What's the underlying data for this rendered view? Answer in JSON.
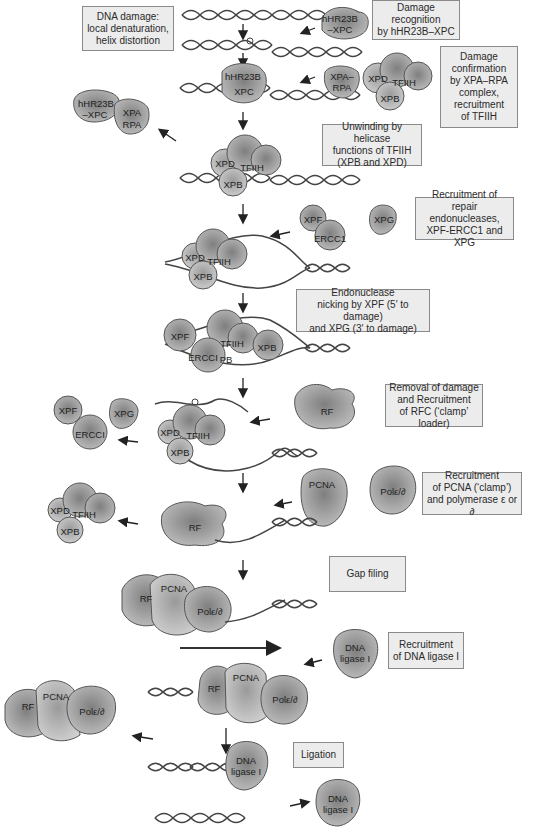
{
  "colors": {
    "protein_fill": "#a9a9a9",
    "protein_stroke": "#555555",
    "dna": "#444444",
    "box_fill": "#ececec",
    "box_border": "#8a8a8a",
    "arrow": "#222222"
  },
  "steps": [
    {
      "id": "dna-damage",
      "text": "DNA damage:\nlocal denaturation,\nhelix distortion"
    },
    {
      "id": "damage-recognition",
      "text": "Damage\nrecognition\nby hHR23B–XPC"
    },
    {
      "id": "damage-confirmation",
      "text": "Damage\nconfirmation\nby XPA–RPA\ncomplex,\nrecruitment\nof TFIIH"
    },
    {
      "id": "unwinding",
      "text": "Unwinding by helicase\nfunctions of TFIIH\n(XPB and XPD)"
    },
    {
      "id": "recruit-endonucleases",
      "text": "Recruitment of repair\nendonucleases,\nXPF-ERCC1 and XPG"
    },
    {
      "id": "endonuclease-nicking",
      "text": "Endonuclease\nnicking by XPF (5′ to damage)\nand XPG (3′ to damage)"
    },
    {
      "id": "removal-rfc",
      "text": "Removal of damage\nand Recruitment\nof RFC (‘clamp’ loader)"
    },
    {
      "id": "recruit-pcna-pol",
      "text": "Recruitment\nof PCNA (‘clamp’)\nand polymerase ε or ∂"
    },
    {
      "id": "gap-filling",
      "text": "Gap filing"
    },
    {
      "id": "recruit-ligase",
      "text": "Recruitment\nof DNA ligase I"
    },
    {
      "id": "ligation",
      "text": "Ligation"
    }
  ],
  "proteins": {
    "hhr23b_xpc": "hHR23B\n–XPC",
    "hhr23b": "hHR23B",
    "xpc": "XPC",
    "xpa_rpa": "XPA–\nRPA",
    "xpa": "XPA",
    "rpa": "RPA",
    "xpd": "XPD",
    "xpb": "XPB",
    "tfiih": "TFIIH",
    "xpf": "XPF",
    "ercc1": "ERCC1",
    "ercci": "ERCCI",
    "xpg": "XPG",
    "rf": "RF",
    "pcna": "PCNA",
    "pol": "Polε/∂",
    "ligase": "DNA\nligase I",
    "pb": "PB"
  }
}
